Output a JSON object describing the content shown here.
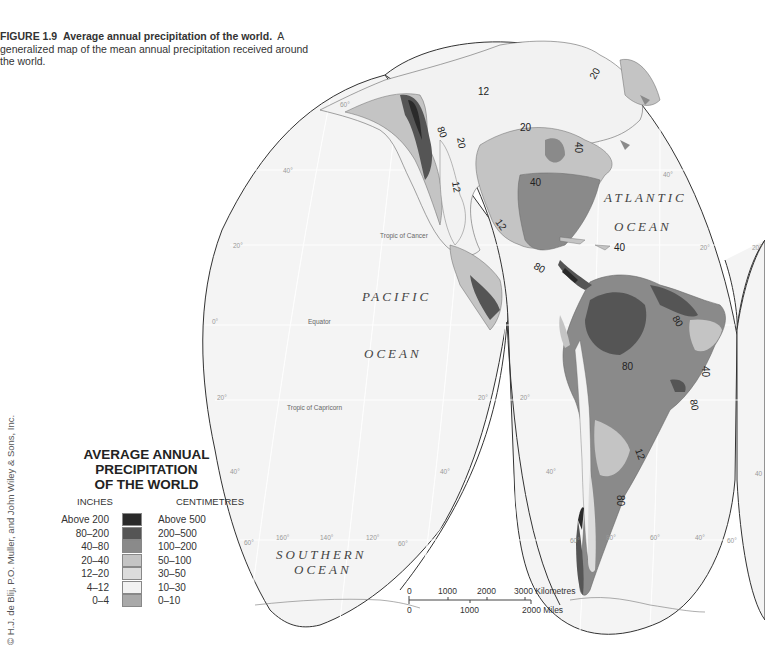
{
  "caption": {
    "figure_label": "FIGURE 1.9",
    "title": "Average annual precipitation of the world.",
    "description": "A generalized map of the mean annual precipitation received around the world."
  },
  "legend": {
    "title_lines": [
      "AVERAGE ANNUAL",
      "PRECIPITATION",
      "OF THE WORLD"
    ],
    "inches_header": "INCHES",
    "centimetres_header": "CENTIMETRES",
    "classes": [
      {
        "inches": "Above 200",
        "centimetres": "Above 500",
        "color": "#2a2a2a"
      },
      {
        "inches": "80–200",
        "centimetres": "200–500",
        "color": "#555555"
      },
      {
        "inches": "40–80",
        "centimetres": "100–200",
        "color": "#8a8a8a"
      },
      {
        "inches": "20–40",
        "centimetres": "50–100",
        "color": "#c4c4c4"
      },
      {
        "inches": "12–20",
        "centimetres": "30–50",
        "color": "#dcdcdc"
      },
      {
        "inches": "4–12",
        "centimetres": "10–30",
        "color": "#f2f2f2"
      },
      {
        "inches": "0–4",
        "centimetres": "0–10",
        "color": "#a9a9a9"
      }
    ]
  },
  "copyright": "© H.J. de Blij, P.O. Muller, and John Wiley & Sons, Inc.",
  "map": {
    "oceans": {
      "pacific_1": "PACIFIC",
      "pacific_2": "OCEAN",
      "atlantic_1": "ATLANTIC",
      "atlantic_2": "OCEAN",
      "southern_1": "SOUTHERN",
      "southern_2": "OCEAN"
    },
    "lines": {
      "tropic_cancer": "Tropic of Cancer",
      "equator": "Equator",
      "tropic_capricorn": "Tropic of Capricorn"
    },
    "graticule": {
      "lat_60_n": "60°",
      "lat_40_n": "40°",
      "lat_20_n": "20°",
      "lat_0": "0°",
      "lat_20_s": "20°",
      "lat_40_s": "40°",
      "lat_60_s": "60°",
      "lon_160": "160°",
      "lon_140": "140°",
      "lon_120": "120°",
      "lon_80": "80°",
      "lon_60": "60°",
      "lon_40": "40°",
      "atl_40_n": "40°",
      "atl_20_n_a": "20°",
      "atl_20_n_b": "20°",
      "sa_20_a": "20°",
      "sa_20_b": "20°",
      "sa_40_a": "40°",
      "sa_40_b": "40°",
      "sa_60_a": "60°",
      "sa_60_b": "60°",
      "pac_20_e": "20°",
      "pac_40_e": "40°",
      "pac_60_e": "60°",
      "right_40": "40"
    },
    "isohyets": {
      "alaska_80": "80",
      "nw_20": "20",
      "canada_12": "12",
      "canada_20": "20",
      "greenland_20": "20",
      "east_40": "40",
      "east_40b": "40",
      "sw_12": "12",
      "mex_12": "12",
      "carib_40": "40",
      "ca_80": "80",
      "amazon_80": "80",
      "guiana_80": "80",
      "brazil_40": "40",
      "se_80": "80",
      "andes_12": "12",
      "chile_80": "80"
    },
    "scale": {
      "km_ticks": [
        "0",
        "1000",
        "2000",
        "3000 Kilometres"
      ],
      "mi_ticks": [
        "0",
        "1000",
        "2000 Miles"
      ]
    }
  }
}
